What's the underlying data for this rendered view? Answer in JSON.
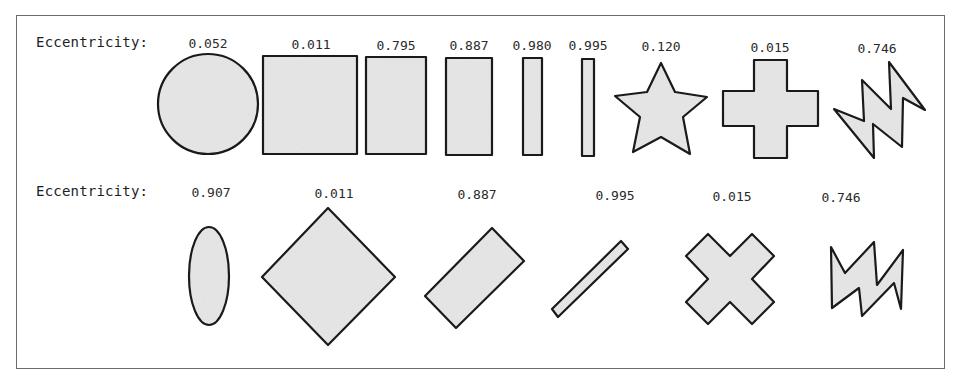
{
  "figure": {
    "row_label": "Eccentricity:",
    "fill_color": "#e6e6e6",
    "stroke_color": "#1a1a1a",
    "frame_color": "#6b6b6b"
  },
  "rows": [
    {
      "label": "Eccentricity:",
      "shapes": [
        {
          "kind": "circle",
          "eccentricity": "0.052"
        },
        {
          "kind": "square",
          "eccentricity": "0.011"
        },
        {
          "kind": "rectangle",
          "eccentricity": "0.795"
        },
        {
          "kind": "rectangle",
          "eccentricity": "0.887"
        },
        {
          "kind": "thin-rectangle",
          "eccentricity": "0.980"
        },
        {
          "kind": "very-thin-rectangle",
          "eccentricity": "0.995"
        },
        {
          "kind": "star",
          "eccentricity": "0.120"
        },
        {
          "kind": "cross",
          "eccentricity": "0.015"
        },
        {
          "kind": "zigzag",
          "eccentricity": "0.746"
        }
      ]
    },
    {
      "label": "Eccentricity:",
      "shapes": [
        {
          "kind": "ellipse",
          "eccentricity": "0.907"
        },
        {
          "kind": "rotated-square",
          "eccentricity": "0.011"
        },
        {
          "kind": "rotated-rectangle",
          "eccentricity": "0.887"
        },
        {
          "kind": "rotated-thin-rectangle",
          "eccentricity": "0.995"
        },
        {
          "kind": "rotated-cross",
          "eccentricity": "0.015"
        },
        {
          "kind": "rotated-zigzag",
          "eccentricity": "0.746"
        }
      ]
    }
  ]
}
